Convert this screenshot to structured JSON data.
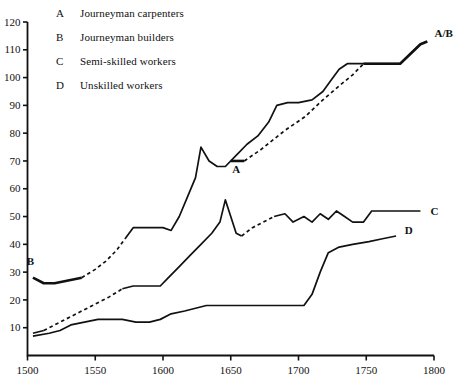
{
  "legend": {
    "rows": [
      {
        "key": "A",
        "label": "Journeyman carpenters"
      },
      {
        "key": "B",
        "label": "Journeyman builders"
      },
      {
        "key": "C",
        "label": "Semi-skilled workers"
      },
      {
        "key": "D",
        "label": "Unskilled workers"
      }
    ]
  },
  "labels": {
    "a": "A",
    "b": "B",
    "c": "C",
    "d": "D",
    "ab": "A/B"
  },
  "chart_data": {
    "type": "line",
    "title": "",
    "subtitle": "",
    "xlabel": "",
    "ylabel": "",
    "xlim": [
      1500,
      1800
    ],
    "ylim": [
      0,
      120
    ],
    "grid": false,
    "legend_position": "top-left",
    "xticks": [
      1500,
      1550,
      1600,
      1650,
      1700,
      1750,
      1800
    ],
    "yticks": [
      0,
      10,
      20,
      30,
      40,
      50,
      60,
      70,
      80,
      90,
      100,
      110,
      120
    ],
    "series": [
      {
        "name": "A",
        "legend": "Journeyman carpenters",
        "style": "solid-then-dashed-then-solid",
        "segments": [
          {
            "dash": false,
            "points": [
              [
                1650,
                70
              ],
              [
                1660,
                70
              ]
            ]
          },
          {
            "dash": true,
            "points": [
              [
                1660,
                70
              ],
              [
                1672,
                74
              ],
              [
                1690,
                81
              ],
              [
                1705,
                86
              ],
              [
                1718,
                92
              ],
              [
                1730,
                97
              ],
              [
                1740,
                101
              ],
              [
                1748,
                105
              ]
            ]
          },
          {
            "dash": false,
            "points": [
              [
                1748,
                105
              ],
              [
                1775,
                105
              ],
              [
                1790,
                112
              ],
              [
                1795,
                113
              ]
            ]
          }
        ]
      },
      {
        "name": "B",
        "legend": "Journeyman builders",
        "style": "solid-then-dashed-then-solid",
        "segments": [
          {
            "dash": false,
            "points": [
              [
                1504,
                28
              ],
              [
                1512,
                26
              ],
              [
                1520,
                26
              ],
              [
                1530,
                27
              ],
              [
                1540,
                28
              ]
            ]
          },
          {
            "dash": true,
            "points": [
              [
                1540,
                28
              ],
              [
                1550,
                31
              ],
              [
                1558,
                34
              ],
              [
                1566,
                38
              ],
              [
                1572,
                42
              ]
            ]
          },
          {
            "dash": false,
            "points": [
              [
                1572,
                42
              ],
              [
                1578,
                46
              ],
              [
                1590,
                46
              ],
              [
                1600,
                46
              ],
              [
                1606,
                45
              ],
              [
                1612,
                50
              ],
              [
                1618,
                57
              ],
              [
                1624,
                64
              ],
              [
                1628,
                75
              ],
              [
                1634,
                70
              ],
              [
                1640,
                68
              ],
              [
                1646,
                68
              ],
              [
                1654,
                72
              ],
              [
                1662,
                76
              ],
              [
                1670,
                79
              ],
              [
                1678,
                84
              ],
              [
                1684,
                90
              ],
              [
                1692,
                91
              ],
              [
                1700,
                91
              ],
              [
                1710,
                92
              ],
              [
                1718,
                95
              ],
              [
                1724,
                99
              ],
              [
                1730,
                103
              ],
              [
                1736,
                105
              ],
              [
                1748,
                105
              ],
              [
                1775,
                105
              ],
              [
                1790,
                112
              ],
              [
                1795,
                113
              ]
            ]
          }
        ]
      },
      {
        "name": "C",
        "legend": "Semi-skilled workers",
        "style": "solid-then-dashed-then-solid",
        "segments": [
          {
            "dash": false,
            "points": [
              [
                1504,
                8
              ],
              [
                1512,
                9
              ]
            ]
          },
          {
            "dash": true,
            "points": [
              [
                1512,
                9
              ],
              [
                1524,
                12
              ],
              [
                1536,
                15
              ],
              [
                1548,
                18
              ],
              [
                1560,
                21
              ],
              [
                1570,
                24
              ]
            ]
          },
          {
            "dash": false,
            "points": [
              [
                1570,
                24
              ],
              [
                1578,
                25
              ],
              [
                1590,
                25
              ],
              [
                1598,
                25
              ],
              [
                1604,
                28
              ],
              [
                1612,
                32
              ],
              [
                1620,
                36
              ],
              [
                1628,
                40
              ],
              [
                1636,
                44
              ],
              [
                1642,
                48
              ],
              [
                1646,
                56
              ],
              [
                1650,
                50
              ],
              [
                1654,
                44
              ],
              [
                1658,
                43
              ]
            ]
          },
          {
            "dash": true,
            "points": [
              [
                1658,
                43
              ],
              [
                1666,
                46
              ],
              [
                1674,
                48
              ],
              [
                1682,
                50
              ]
            ]
          },
          {
            "dash": false,
            "points": [
              [
                1682,
                50
              ],
              [
                1690,
                51
              ],
              [
                1696,
                48
              ],
              [
                1704,
                50
              ],
              [
                1710,
                48
              ],
              [
                1716,
                51
              ],
              [
                1722,
                49
              ],
              [
                1728,
                52
              ],
              [
                1734,
                50
              ],
              [
                1740,
                48
              ],
              [
                1748,
                48
              ],
              [
                1754,
                52
              ],
              [
                1764,
                52
              ],
              [
                1790,
                52
              ]
            ]
          }
        ]
      },
      {
        "name": "D",
        "legend": "Unskilled workers",
        "style": "solid",
        "segments": [
          {
            "dash": false,
            "points": [
              [
                1504,
                7
              ],
              [
                1516,
                8
              ],
              [
                1524,
                9
              ],
              [
                1532,
                11
              ],
              [
                1542,
                12
              ],
              [
                1552,
                13
              ],
              [
                1560,
                13
              ],
              [
                1570,
                13
              ],
              [
                1580,
                12
              ],
              [
                1590,
                12
              ],
              [
                1598,
                13
              ],
              [
                1606,
                15
              ],
              [
                1616,
                16
              ],
              [
                1624,
                17
              ],
              [
                1632,
                18
              ],
              [
                1640,
                18
              ],
              [
                1648,
                18
              ],
              [
                1656,
                18
              ],
              [
                1664,
                18
              ],
              [
                1676,
                18
              ],
              [
                1686,
                18
              ],
              [
                1696,
                18
              ],
              [
                1704,
                18
              ],
              [
                1710,
                22
              ],
              [
                1716,
                30
              ],
              [
                1722,
                37
              ],
              [
                1730,
                39
              ],
              [
                1740,
                40
              ],
              [
                1752,
                41
              ],
              [
                1762,
                42
              ],
              [
                1772,
                43
              ]
            ]
          }
        ]
      }
    ],
    "annotations": [
      {
        "text": "A",
        "x": 1654,
        "y": 70,
        "placement": "below"
      },
      {
        "text": "B",
        "x": 1501,
        "y": 30,
        "placement": "left-above"
      },
      {
        "text": "C",
        "x": 1793,
        "y": 52,
        "placement": "right"
      },
      {
        "text": "D",
        "x": 1774,
        "y": 43,
        "placement": "right-above"
      },
      {
        "text": "A/B",
        "x": 1796,
        "y": 114,
        "placement": "right-above"
      }
    ]
  }
}
